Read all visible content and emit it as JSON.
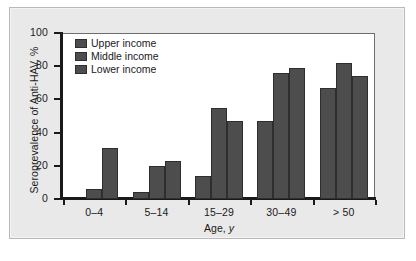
{
  "chart_data": {
    "type": "bar",
    "title": "",
    "xlabel": "Age, y",
    "ylabel": "Seroprevalence of Anti-HAV, %",
    "categories": [
      "0–4",
      "5–14",
      "15–29",
      "30–49",
      "> 50"
    ],
    "series": [
      {
        "name": "Upper income",
        "values": [
          0,
          4,
          14,
          47,
          67
        ]
      },
      {
        "name": "Middle income",
        "values": [
          6,
          20,
          55,
          76,
          82
        ]
      },
      {
        "name": "Lower income",
        "values": [
          31,
          23,
          47,
          79,
          74
        ]
      }
    ],
    "ylim": [
      0,
      100
    ],
    "yticks": [
      0,
      20,
      40,
      60,
      80,
      100
    ],
    "ytick_labels": [
      "0",
      "20",
      "40",
      "60",
      "80",
      "100"
    ],
    "grid": false,
    "legend_position": "top-left",
    "bar_color": "#4d4d4d",
    "bar_edge_color": "#2e2e2e",
    "axis_color": "#1a1a1a",
    "plot_background": "#ffffff",
    "panel_background": "#e9e9e9"
  },
  "legend": {
    "items": [
      {
        "label": "Upper income"
      },
      {
        "label": "Middle income"
      },
      {
        "label": "Lower income"
      }
    ]
  }
}
